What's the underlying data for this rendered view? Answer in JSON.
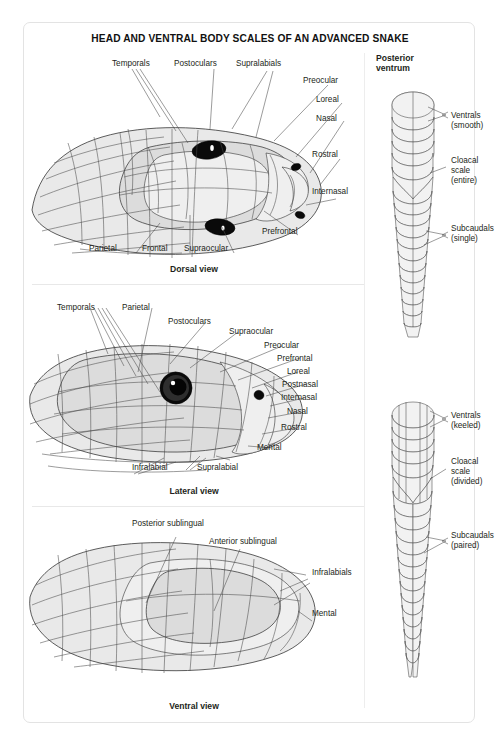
{
  "title": "HEAD AND VENTRAL BODY SCALES OF AN ADVANCED SNAKE",
  "panels": {
    "dorsal": {
      "caption": "Dorsal view",
      "labels": [
        {
          "text": "Temporals"
        },
        {
          "text": "Postoculars"
        },
        {
          "text": "Supralabials"
        },
        {
          "text": "Preocular"
        },
        {
          "text": "Loreal"
        },
        {
          "text": "Nasal"
        },
        {
          "text": "Rostral"
        },
        {
          "text": "Internasal"
        },
        {
          "text": "Prefrontal"
        },
        {
          "text": "Supraocular"
        },
        {
          "text": "Frontal"
        },
        {
          "text": "Parietal"
        }
      ]
    },
    "lateral": {
      "caption": "Lateral view",
      "labels": [
        {
          "text": "Temporals"
        },
        {
          "text": "Parietal"
        },
        {
          "text": "Postoculars"
        },
        {
          "text": "Supraocular"
        },
        {
          "text": "Preocular"
        },
        {
          "text": "Prefrontal"
        },
        {
          "text": "Loreal"
        },
        {
          "text": "Postnasal"
        },
        {
          "text": "Internasal"
        },
        {
          "text": "Nasal"
        },
        {
          "text": "Rostral"
        },
        {
          "text": "Mental"
        },
        {
          "text": "Supralabial"
        },
        {
          "text": "Infralabial"
        }
      ]
    },
    "ventral": {
      "caption": "Ventral view",
      "labels": [
        {
          "text": "Posterior sublingual"
        },
        {
          "text": "Anterior sublingual"
        },
        {
          "text": "Infralabials"
        },
        {
          "text": "Mental"
        }
      ]
    },
    "posterior": {
      "heading": "Posterior\nventrum",
      "top": {
        "ventrals": "Ventrals\n(smooth)",
        "cloacal": "Cloacal\nscale\n(entire)",
        "subcaudals": "Subcaudals\n(single)"
      },
      "bottom": {
        "ventrals": "Ventrals\n(keeled)",
        "cloacal": "Cloacal\nscale\n(divided)",
        "subcaudals": "Subcaudals\n(paired)"
      }
    }
  }
}
